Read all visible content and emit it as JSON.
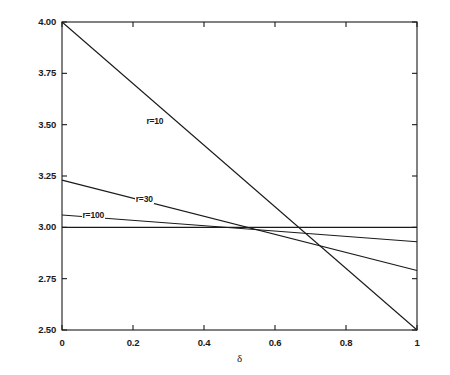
{
  "chart_data": {
    "type": "line",
    "title": "",
    "subtitle": "",
    "xlabel": "δ",
    "ylabel": "",
    "xlim": [
      0,
      1
    ],
    "ylim": [
      2.5,
      4.0
    ],
    "grid": false,
    "legend_position": "inline-labels",
    "background_color": "#ffffff",
    "line_color": "#1a1a1a",
    "xticks": [
      {
        "value": 0,
        "label": "0"
      },
      {
        "value": 0.2,
        "label": "0.2"
      },
      {
        "value": 0.4,
        "label": "0.4"
      },
      {
        "value": 0.6,
        "label": "0.6"
      },
      {
        "value": 0.8,
        "label": "0.8"
      },
      {
        "value": 1,
        "label": "1"
      }
    ],
    "yticks": [
      {
        "value": 2.5,
        "label": "2.50"
      },
      {
        "value": 2.75,
        "label": "2.75"
      },
      {
        "value": 3.0,
        "label": "3.00"
      },
      {
        "value": 3.25,
        "label": "3.25"
      },
      {
        "value": 3.5,
        "label": "3.50"
      },
      {
        "value": 3.75,
        "label": "3.75"
      },
      {
        "value": 4.0,
        "label": "4.00"
      }
    ],
    "series": [
      {
        "name": "r=10",
        "label": "r=10",
        "label_x": 0.235,
        "label_y": 3.515,
        "x": [
          0,
          1
        ],
        "values": [
          4.0,
          2.5
        ]
      },
      {
        "name": "r=30",
        "label": "r=30",
        "label_x": 0.205,
        "label_y": 3.135,
        "x": [
          0,
          1
        ],
        "values": [
          3.23,
          2.79
        ]
      },
      {
        "name": "r=100",
        "label": "r=100",
        "label_x": 0.055,
        "label_y": 3.055,
        "x": [
          0,
          1
        ],
        "values": [
          3.06,
          2.93
        ]
      },
      {
        "name": "baseline",
        "label": "",
        "label_x": null,
        "label_y": null,
        "x": [
          0,
          1
        ],
        "values": [
          3.0,
          3.0
        ]
      }
    ]
  }
}
